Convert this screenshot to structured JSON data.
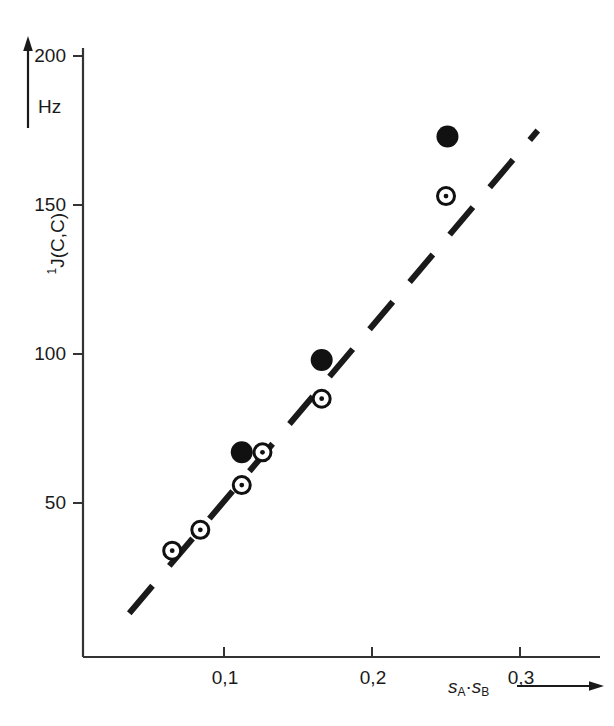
{
  "figure": {
    "background_color": "#ffffff",
    "ink_color": "#1a1a1a",
    "width": 614,
    "height": 726
  },
  "axes": {
    "y_title_pre": "1",
    "y_title_main": "J(C,C)",
    "y_unit_label": "Hz",
    "x_title_a": "s",
    "x_title_a_sub": "A",
    "x_title_dot": "·",
    "x_title_b": "s",
    "x_title_b_sub": "B",
    "y_arrow_name": "up-arrow-icon",
    "x_arrow_name": "right-arrow-icon"
  },
  "chart_data": {
    "type": "scatter",
    "title": "",
    "xlabel": "s_A · s_B",
    "ylabel": "1J(C,C)",
    "yunit": "Hz",
    "xlim": [
      0.016,
      0.346
    ],
    "ylim": [
      0.0,
      215.0
    ],
    "grid": false,
    "legend_position": "none",
    "xticks": [
      0.1,
      0.2,
      0.3
    ],
    "xticklabels": [
      "0,1",
      "0,2",
      "0,3"
    ],
    "yticks": [
      50,
      100,
      150,
      200
    ],
    "yticklabels": [
      "50",
      "100",
      "150",
      "200"
    ],
    "series": [
      {
        "name": "filled-circle-series",
        "marker": "filled-circle",
        "x": [
          0.112,
          0.166,
          0.251
        ],
        "y": [
          67,
          98,
          173
        ]
      },
      {
        "name": "open-circle-series",
        "marker": "open-circle-dot",
        "x": [
          0.065,
          0.084,
          0.112,
          0.126,
          0.166,
          0.25
        ],
        "y": [
          34,
          41,
          56,
          67,
          85,
          153
        ]
      }
    ],
    "annotations": [
      {
        "name": "dashed-trend-line",
        "type": "dashed-line",
        "x0": 0.036,
        "y0": 13,
        "x1": 0.312,
        "y1": 175
      }
    ]
  }
}
